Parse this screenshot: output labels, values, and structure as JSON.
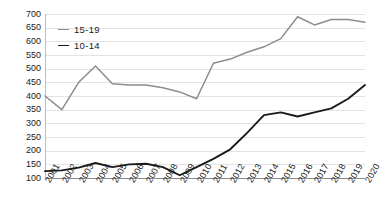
{
  "chart_data": {
    "type": "line",
    "title": "",
    "xlabel": "",
    "ylabel": "",
    "grid": true,
    "legend_position": "top-left",
    "ylim": [
      100,
      700
    ],
    "yticks": [
      100,
      150,
      200,
      250,
      300,
      350,
      400,
      450,
      500,
      550,
      600,
      650,
      700
    ],
    "categories": [
      "2001",
      "2002",
      "2003",
      "2004",
      "2005",
      "2006",
      "2007",
      "2008",
      "2009",
      "2010",
      "2011",
      "2012",
      "2013",
      "2014",
      "2015",
      "2016",
      "2017",
      "2018",
      "2019",
      "2020"
    ],
    "series": [
      {
        "name": "15-19",
        "color": "#8c8c8c",
        "values": [
          400,
          350,
          450,
          510,
          445,
          440,
          440,
          430,
          415,
          390,
          520,
          535,
          560,
          580,
          610,
          690,
          660,
          680,
          680,
          670
        ]
      },
      {
        "name": "10-14",
        "color": "#1a1a1a",
        "values": [
          125,
          128,
          138,
          155,
          140,
          150,
          152,
          140,
          110,
          140,
          170,
          205,
          265,
          330,
          340,
          325,
          340,
          355,
          390,
          440
        ]
      }
    ]
  },
  "legend": {
    "items": [
      {
        "label": "15-19",
        "color": "#8c8c8c"
      },
      {
        "label": "10-14",
        "color": "#1a1a1a"
      }
    ]
  },
  "axes": {
    "y_min_label": "100",
    "y_max_label": "700"
  }
}
